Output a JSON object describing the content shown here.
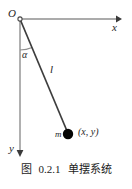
{
  "figure": {
    "caption_prefix": "图",
    "caption_number": "0.2.1",
    "caption_title": "单摆系统",
    "caption_full": "图 0.2.1　单摆系统",
    "background_color": "#ffffff",
    "line_color": "#4a4a4a",
    "axis_color": "#8a8a8a",
    "bob_color": "#000000",
    "text_color": "#1a1a1a",
    "width": 132,
    "height": 189
  },
  "labels": {
    "origin": "O",
    "x_axis": "x",
    "y_axis": "y",
    "angle": "α",
    "length": "l",
    "mass": "m",
    "coordinates": "(x, y)"
  },
  "geometry": {
    "origin_point": {
      "x": 20,
      "y": 19
    },
    "x_axis_end": {
      "x": 118,
      "y": 19
    },
    "y_axis_end": {
      "x": 20,
      "y": 156
    },
    "bob_center": {
      "x": 68,
      "y": 134
    },
    "bob_radius": 5,
    "string_length_px": 124,
    "angle_arc_radius": 31,
    "angle_degrees": 23
  }
}
